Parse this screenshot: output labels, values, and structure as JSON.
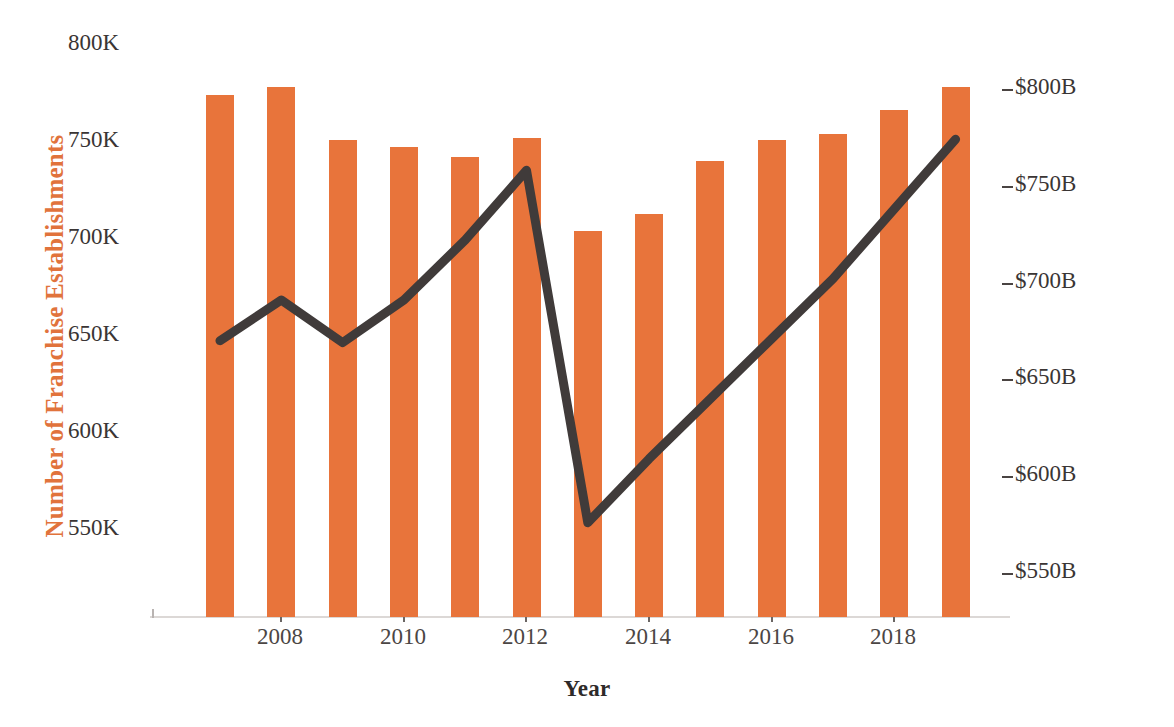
{
  "chart_data": {
    "type": "bar",
    "title": "",
    "xlabel": "Year",
    "categories": [
      "2007",
      "2008",
      "2009",
      "2010",
      "2011",
      "2012",
      "2013",
      "2014",
      "2015",
      "2016",
      "2017",
      "2018",
      "2019"
    ],
    "x_tick_labels": [
      "2008",
      "2010",
      "2012",
      "2014",
      "2016",
      "2018"
    ],
    "grid": false,
    "legend": "none",
    "series": [
      {
        "name": "Number of Franchise Establishments",
        "type": "bar",
        "color": "#E8743B",
        "axis": "left",
        "unit": "K",
        "ylabel": "Number of Franchise Establishments",
        "ylim": [
          506000,
          800000
        ],
        "y_tick_labels": [
          "800K",
          "750K",
          "700K",
          "650K",
          "600K",
          "550K"
        ],
        "y_tick_values": [
          800000,
          750000,
          700000,
          650000,
          600000,
          550000
        ],
        "values": [
          773000,
          777000,
          750000,
          746000,
          741000,
          751000,
          703000,
          712000,
          739000,
          750000,
          753000,
          765000,
          777000
        ]
      },
      {
        "name": "Output (in billions)",
        "type": "line",
        "color": "#403B3A",
        "axis": "right",
        "unit": "B",
        "ylabel": "Output (in billions)",
        "ylim": [
          520,
          800
        ],
        "y_tick_labels": [
          "$800B",
          "$750B",
          "$700B",
          "$650B",
          "$600B",
          "$550B"
        ],
        "y_tick_values": [
          800,
          750,
          700,
          650,
          600,
          550
        ],
        "values": [
          670,
          691,
          669,
          691,
          722,
          758,
          576,
          609,
          640,
          671,
          702,
          738,
          774
        ]
      }
    ]
  },
  "axes": {
    "left": {
      "title": "Number of Franchise Establishments",
      "title_color": "#E1733C",
      "ticks": [
        "800K",
        "750K",
        "700K",
        "650K",
        "600K",
        "550K"
      ]
    },
    "right": {
      "title": "Output (in billions)",
      "title_color": "#3B3634",
      "ticks": [
        "$800B",
        "$750B",
        "$700B",
        "$650B",
        "$600B",
        "$550B"
      ]
    },
    "x": {
      "title": "Year",
      "ticks": [
        "2008",
        "2010",
        "2012",
        "2014",
        "2016",
        "2018"
      ]
    }
  },
  "colors": {
    "bar": "#E8743B",
    "line": "#403B3A",
    "background": "#FFFFFF"
  }
}
